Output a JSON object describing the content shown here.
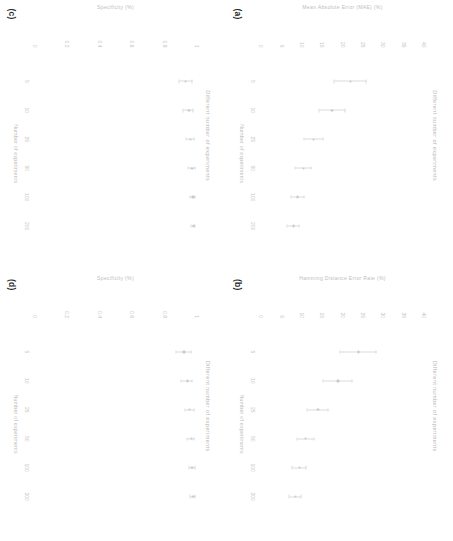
{
  "figure": {
    "rotation_deg": 90,
    "panel_count": 4,
    "shared_title": "Different number of experiments",
    "shared_xlabel": "Number of experiments",
    "xticks": [
      "5",
      "10",
      "25",
      "50",
      "100",
      "200"
    ]
  },
  "panels": [
    {
      "letter": "(a)",
      "title": "Different number of experiments",
      "ylabel": "Mean Absolute Error (MAE) (%)",
      "xlabel": "Number of experiments",
      "yticks": [
        "40",
        "35",
        "30",
        "25",
        "20",
        "15",
        "10",
        "5",
        "0"
      ]
    },
    {
      "letter": "(b)",
      "title": "Different number of experiments",
      "ylabel": "Hamming Distance Error Rate (%)",
      "xlabel": "Number of experiments",
      "yticks": [
        "40",
        "35",
        "30",
        "25",
        "20",
        "15",
        "10",
        "5",
        "0"
      ]
    },
    {
      "letter": "(c)",
      "title": "Different number of experiments",
      "ylabel": "Specificity (%)",
      "xlabel": "Number of experiments",
      "yticks": [
        "1",
        "0.8",
        "0.6",
        "0.4",
        "0.2",
        "0"
      ]
    },
    {
      "letter": "(d)",
      "title": "Different number of experiments",
      "ylabel": "Specificity (%)",
      "xlabel": "Number of experiments",
      "yticks": [
        "1",
        "0.8",
        "0.6",
        "0.4",
        "0.2",
        "0"
      ]
    }
  ],
  "chart_data": [
    {
      "type": "scatter",
      "panel": "(a)",
      "title": "Different number of experiments",
      "xlabel": "Number of experiments",
      "ylabel": "Mean Absolute Error (MAE) (%)",
      "x": [
        5,
        10,
        25,
        50,
        100,
        200
      ],
      "values": [
        22.0,
        17.5,
        13.0,
        10.5,
        9.0,
        8.0
      ],
      "errors": [
        4.0,
        3.2,
        2.4,
        2.0,
        1.6,
        1.4
      ],
      "xlim": [
        0,
        7
      ],
      "ylim": [
        0,
        40
      ],
      "grid": false,
      "legend": "none"
    },
    {
      "type": "scatter",
      "panel": "(b)",
      "title": "Different number of experiments",
      "xlabel": "Number of experiments",
      "ylabel": "Hamming Distance Error Rate (%)",
      "x": [
        5,
        10,
        25,
        50,
        100,
        200
      ],
      "values": [
        24.0,
        19.0,
        14.0,
        11.0,
        9.5,
        8.5
      ],
      "errors": [
        4.5,
        3.5,
        2.6,
        2.1,
        1.7,
        1.5
      ],
      "xlim": [
        0,
        7
      ],
      "ylim": [
        0,
        40
      ],
      "grid": false,
      "legend": "none"
    },
    {
      "type": "scatter",
      "panel": "(c)",
      "title": "Different number of experiments",
      "xlabel": "Number of experiments",
      "ylabel": "Specificity (%)",
      "x": [
        5,
        10,
        25,
        50,
        100,
        200
      ],
      "values": [
        0.93,
        0.95,
        0.96,
        0.97,
        0.975,
        0.98
      ],
      "errors": [
        0.04,
        0.03,
        0.025,
        0.02,
        0.015,
        0.012
      ],
      "xlim": [
        0,
        7
      ],
      "ylim": [
        0,
        1
      ],
      "grid": false,
      "legend": "none"
    },
    {
      "type": "scatter",
      "panel": "(d)",
      "title": "Different number of experiments",
      "xlabel": "Number of experiments",
      "ylabel": "Specificity (%)",
      "x": [
        5,
        10,
        25,
        50,
        100,
        200
      ],
      "values": [
        0.92,
        0.94,
        0.955,
        0.965,
        0.97,
        0.975
      ],
      "errors": [
        0.045,
        0.035,
        0.028,
        0.022,
        0.018,
        0.014
      ],
      "xlim": [
        0,
        7
      ],
      "ylim": [
        0,
        1
      ],
      "grid": false,
      "legend": "none"
    }
  ]
}
